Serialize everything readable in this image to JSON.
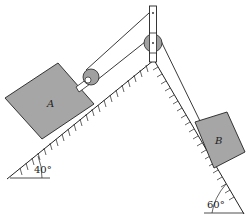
{
  "diagram": {
    "type": "two blocks on inclined planes connected by rope over pulley",
    "blocks": [
      {
        "id": "A",
        "label": "A",
        "incline": "left"
      },
      {
        "id": "B",
        "label": "B",
        "incline": "right"
      }
    ],
    "inclines": [
      {
        "side": "left",
        "angle_label": "40°"
      },
      {
        "side": "right",
        "angle_label": "60°"
      }
    ],
    "colors": {
      "block_fill": "#a6a6a6",
      "pulley_fill": "#a0a0a0",
      "line": "#222222",
      "background": "#ffffff"
    }
  }
}
